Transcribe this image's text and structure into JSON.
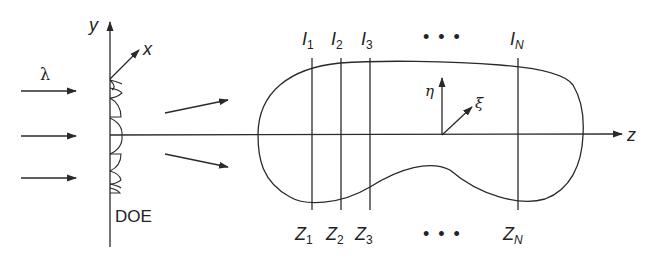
{
  "diagram": {
    "input": {
      "wavelength_label": "λ",
      "incident_arrows": 3
    },
    "element": {
      "label": "DOE"
    },
    "axes": {
      "y": "y",
      "x": "x",
      "z": "z",
      "eta": "η",
      "xi": "ξ"
    },
    "planes": [
      {
        "intensity_label": "I",
        "intensity_sub": "1",
        "position_label": "Z",
        "position_sub": "1"
      },
      {
        "intensity_label": "I",
        "intensity_sub": "2",
        "position_label": "Z",
        "position_sub": "2"
      },
      {
        "intensity_label": "I",
        "intensity_sub": "3",
        "position_label": "Z",
        "position_sub": "3"
      },
      {
        "intensity_label": "I",
        "intensity_sub": "N",
        "position_label": "Z",
        "position_sub": "N"
      }
    ],
    "ellipsis": "• • •",
    "colors": {
      "stroke": "#2a2a2a",
      "background": "#ffffff"
    }
  }
}
